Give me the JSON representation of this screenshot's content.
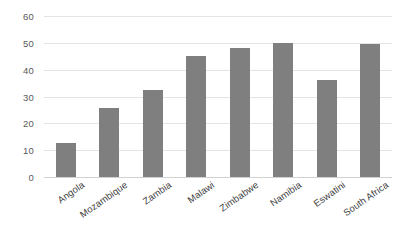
{
  "chart_data": {
    "type": "bar",
    "title": "",
    "subtitle": "",
    "xlabel": "",
    "ylabel": "",
    "categories": [
      "Angola",
      "Mozambique",
      "Zambia",
      "Malawi",
      "Zimbabwe",
      "Namibia",
      "Eswatini",
      "South Africa"
    ],
    "values": [
      12.7,
      25.7,
      32.4,
      45.1,
      48.1,
      50.0,
      36.2,
      49.6
    ],
    "series": [
      {
        "name": "",
        "values": [
          12.7,
          25.7,
          32.4,
          45.1,
          48.1,
          50.0,
          36.2,
          49.6
        ]
      }
    ],
    "ylim": [
      0,
      60
    ],
    "yticks": [
      0,
      10,
      20,
      30,
      40,
      50,
      60
    ],
    "ytick_labels": [
      "0",
      "10",
      "20",
      "30",
      "40",
      "50",
      "60"
    ],
    "grid": "horizontal",
    "legend": "none",
    "bar_color": "#7f7f7f",
    "gridline_color": "#e4e4e4",
    "axis_text_color": "#595959",
    "category_text_color": "#404040",
    "background_color": "#ffffff",
    "xtick_label_rotation_deg": -35
  }
}
